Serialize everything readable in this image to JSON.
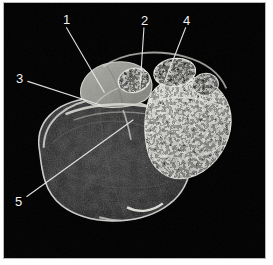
{
  "figure": {
    "type": "annotated-grayscale-cross-section",
    "background_color": "#000000",
    "page_color": "#ffffff",
    "frame_color": "#b8b8b8",
    "label_color": "#f2f2f2",
    "leader_color": "#e8e8e8",
    "width_px": 273,
    "height_px": 265,
    "image_region": {
      "x": 3,
      "y": 2,
      "width": 263,
      "height": 257
    }
  },
  "annotations": [
    {
      "id": "label-1",
      "text": "1",
      "label_x": 62,
      "label_y": 12,
      "leader": {
        "x1": 66,
        "y1": 27,
        "x2": 104,
        "y2": 92
      }
    },
    {
      "id": "label-2",
      "text": "2",
      "label_x": 140,
      "label_y": 13,
      "leader": {
        "x1": 144,
        "y1": 27,
        "x2": 140,
        "y2": 88
      }
    },
    {
      "id": "label-3",
      "text": "3",
      "label_x": 15,
      "label_y": 71,
      "leader": {
        "x1": 27,
        "y1": 81,
        "x2": 101,
        "y2": 105
      }
    },
    {
      "id": "label-4",
      "text": "4",
      "label_x": 182,
      "label_y": 13,
      "leader": {
        "x1": 186,
        "y1": 27,
        "x2": 165,
        "y2": 81
      }
    },
    {
      "id": "label-5",
      "text": "5",
      "label_x": 14,
      "label_y": 194,
      "leader": {
        "x1": 26,
        "y1": 197,
        "x2": 133,
        "y2": 120
      }
    }
  ],
  "specimen_regions": [
    {
      "name": "large-dark-mass",
      "description": "large rounded dark low-signal mass occupying lower-left of the section, with a bright thin rim",
      "fill": "#1c1c1c",
      "rim": "#cfcfcf"
    },
    {
      "name": "pale-homogeneous-lobe",
      "description": "pale grey homogeneous lobe at upper-left of the section",
      "fill": "#9a9a96"
    },
    {
      "name": "granular-porous-region",
      "description": "bright granular / porous high-contrast trabecular region on the right of the section",
      "fill": "#b6b6b0"
    },
    {
      "name": "small-round-cavities",
      "description": "two small round cavity profiles along the top edge filled with coarse granular material",
      "fill": "#8e8e88"
    }
  ]
}
